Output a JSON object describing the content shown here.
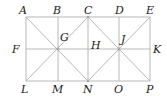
{
  "diagram": {
    "type": "geometry-figure",
    "line_color": "#b8b8b8",
    "label_color": "#1a1a1a",
    "points": {
      "A": {
        "label": "A",
        "x": 26,
        "y": 17
      },
      "B": {
        "label": "B",
        "x": 58,
        "y": 17
      },
      "C": {
        "label": "C",
        "x": 88,
        "y": 17
      },
      "D": {
        "label": "D",
        "x": 119,
        "y": 17
      },
      "E": {
        "label": "E",
        "x": 150,
        "y": 17
      },
      "F": {
        "label": "F",
        "x": 26,
        "y": 49
      },
      "G": {
        "label": "G",
        "x": 58,
        "y": 49
      },
      "H": {
        "label": "H",
        "x": 88,
        "y": 49
      },
      "J": {
        "label": "J",
        "x": 119,
        "y": 49
      },
      "K": {
        "label": "K",
        "x": 150,
        "y": 49
      },
      "L": {
        "label": "L",
        "x": 26,
        "y": 81
      },
      "M": {
        "label": "M",
        "x": 58,
        "y": 81
      },
      "N": {
        "label": "N",
        "x": 88,
        "y": 81
      },
      "O": {
        "label": "O",
        "x": 119,
        "y": 81
      },
      "P": {
        "label": "P",
        "x": 150,
        "y": 81
      }
    },
    "segments": [
      [
        "A",
        "E"
      ],
      [
        "L",
        "P"
      ],
      [
        "A",
        "L"
      ],
      [
        "E",
        "P"
      ],
      [
        "F",
        "K"
      ],
      [
        "B",
        "M"
      ],
      [
        "C",
        "N"
      ],
      [
        "D",
        "O"
      ],
      [
        "A",
        "N"
      ],
      [
        "C",
        "L"
      ],
      [
        "C",
        "P"
      ],
      [
        "E",
        "N"
      ]
    ]
  }
}
